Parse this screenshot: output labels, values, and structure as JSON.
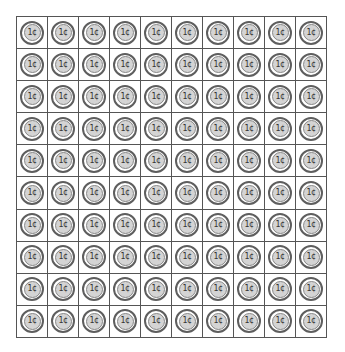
{
  "grid": {
    "rows": 10,
    "columns": 10,
    "coin_label": "1¢",
    "coin_count": 100
  },
  "colors": {
    "grid_line": "#555555",
    "coin_ring": "#5e5e5e",
    "coin_fill": "#d4d4d4",
    "coin_text": "#333333"
  }
}
